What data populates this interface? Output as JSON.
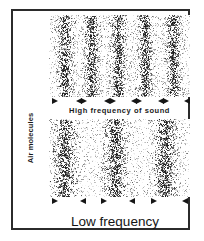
{
  "figure": {
    "title_visible": false,
    "axis_label": "Air molecules",
    "frame_color": "#2b2b2b",
    "background_color": "#ffffff",
    "dot_color": "#1a1a1a"
  },
  "panels": {
    "high": {
      "caption": "High frequency of sound",
      "compression_bands": 5,
      "band_centers_pct": [
        11,
        30,
        49,
        68,
        88
      ],
      "band_width_pct": 7,
      "dot_count": 5200,
      "arrows": [
        {
          "index": 0,
          "direction": "right",
          "left_pct": 2
        },
        {
          "index": 1,
          "direction": "left",
          "left_pct": 19
        },
        {
          "index": 2,
          "direction": "right",
          "left_pct": 23
        },
        {
          "index": 3,
          "direction": "left",
          "left_pct": 39
        },
        {
          "index": 4,
          "direction": "right",
          "left_pct": 43
        },
        {
          "index": 5,
          "direction": "left",
          "left_pct": 58
        },
        {
          "index": 6,
          "direction": "right",
          "left_pct": 62
        },
        {
          "index": 7,
          "direction": "left",
          "left_pct": 77
        },
        {
          "index": 8,
          "direction": "right",
          "left_pct": 81
        },
        {
          "index": 9,
          "direction": "left",
          "left_pct": 96
        }
      ]
    },
    "low": {
      "caption": "Low frequency",
      "compression_bands": 3,
      "band_centers_pct": [
        11,
        47,
        82
      ],
      "band_width_pct": 11,
      "dot_count": 4200,
      "arrows": [
        {
          "index": 0,
          "direction": "right",
          "left_pct": 2
        },
        {
          "index": 1,
          "direction": "left",
          "left_pct": 22
        },
        {
          "index": 2,
          "direction": "right",
          "left_pct": 37
        },
        {
          "index": 3,
          "direction": "left",
          "left_pct": 57
        },
        {
          "index": 4,
          "direction": "right",
          "left_pct": 72
        },
        {
          "index": 5,
          "direction": "left",
          "left_pct": 94
        }
      ]
    }
  },
  "chart_data": {
    "type": "scatter",
    "title": "",
    "xlabel": "",
    "ylabel": "Air molecules",
    "series": [
      {
        "name": "High frequency of sound",
        "band_centers_pct": [
          11,
          30,
          49,
          68,
          88
        ],
        "wavelength_pct": 19,
        "bands": 5
      },
      {
        "name": "Low frequency",
        "band_centers_pct": [
          11,
          47,
          82
        ],
        "wavelength_pct": 35,
        "bands": 3
      }
    ],
    "grid": false,
    "legend": "none"
  }
}
